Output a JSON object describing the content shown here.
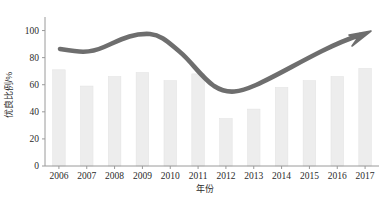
{
  "chart_data": {
    "type": "bar",
    "title": "",
    "subtitle": "",
    "xlabel": "年份",
    "ylabel": "优良比例/%",
    "categories": [
      "2006",
      "2007",
      "2008",
      "2009",
      "2010",
      "2011",
      "2012",
      "2013",
      "2014",
      "2015",
      "2016",
      "2017"
    ],
    "values": [
      71,
      59,
      66,
      69,
      63,
      68,
      35,
      42,
      58,
      63,
      66,
      72
    ],
    "series": [
      {
        "name": "优良比例",
        "values": [
          71,
          59,
          66,
          69,
          63,
          68,
          35,
          42,
          58,
          63,
          66,
          72
        ]
      }
    ],
    "ylim": [
      0,
      110
    ],
    "yticks": [
      0,
      20,
      40,
      60,
      80,
      100
    ],
    "ytick_labels": [
      "0",
      "20",
      "40",
      "60",
      "80",
      "100"
    ],
    "xlim": [
      2005.5,
      2017.5
    ],
    "grid": false,
    "legend": null,
    "legend_position": "none",
    "annotations": [
      {
        "kind": "trend-arrow",
        "label": "",
        "description": "smooth grey trend arrow rising to the upper right"
      }
    ],
    "colors": {
      "bar_fill": "#ededed",
      "bar_edge": "#e4e4e4",
      "axis": "#9a9a9a",
      "text": "#2b2b2b",
      "trend_arrow": "#6e6e6e",
      "background": "#ffffff"
    }
  },
  "axes": {
    "y_axis_name": "y-axis",
    "x_axis_name": "x-axis"
  }
}
